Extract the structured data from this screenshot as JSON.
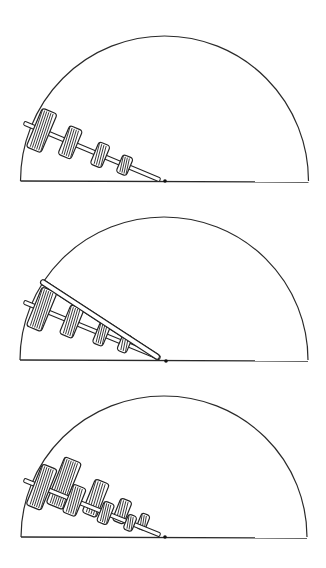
{
  "figure": {
    "stroke_color": "#222222",
    "background": "#ffffff"
  },
  "panels": [
    {
      "id": "panel-1",
      "semicircle": {
        "cx": 164.5,
        "baseline_y": 181,
        "r": 144,
        "top_y": 36
      },
      "pivot": {
        "x": 165,
        "y": 181
      },
      "shaft": {
        "x1": 24,
        "y1": 123,
        "x2": 160,
        "y2": 180,
        "angle_deg": 22.7
      },
      "gears": [
        {
          "t": 0.13,
          "w": 16,
          "h": 42
        },
        {
          "t": 0.34,
          "w": 14,
          "h": 31
        },
        {
          "t": 0.56,
          "w": 12,
          "h": 24
        },
        {
          "t": 0.74,
          "w": 11,
          "h": 19
        }
      ],
      "top_bar": null,
      "second_row": []
    },
    {
      "id": "panel-2",
      "semicircle": {
        "cx": 164,
        "baseline_y": 360,
        "r": 144,
        "top_y": 217
      },
      "pivot": {
        "x": 166,
        "y": 361
      },
      "shaft": {
        "x1": 24,
        "y1": 302,
        "x2": 160,
        "y2": 358,
        "angle_deg": 22.4
      },
      "gears": [
        {
          "t": 0.13,
          "w": 16,
          "h": 42
        },
        {
          "t": 0.35,
          "w": 14,
          "h": 31
        },
        {
          "t": 0.57,
          "w": 11,
          "h": 23
        },
        {
          "t": 0.74,
          "w": 10,
          "h": 18
        }
      ],
      "top_bar": {
        "x1": 41,
        "y1": 281,
        "x2": 159,
        "y2": 358
      },
      "second_row": []
    },
    {
      "id": "panel-3",
      "semicircle": {
        "cx": 164,
        "baseline_y": 537,
        "r": 143,
        "top_y": 396
      },
      "pivot": {
        "x": 165,
        "y": 537
      },
      "shaft": {
        "x1": 24,
        "y1": 480,
        "x2": 160,
        "y2": 535,
        "angle_deg": 22
      },
      "gears": [
        {
          "t": 0.13,
          "w": 16,
          "h": 44
        },
        {
          "t": 0.37,
          "w": 14,
          "h": 30
        },
        {
          "t": 0.6,
          "w": 11,
          "h": 22
        },
        {
          "t": 0.78,
          "w": 9,
          "h": 16
        }
      ],
      "top_bar": null,
      "second_row": [
        {
          "t": 0.26,
          "w": 18,
          "h": 50,
          "offset": -12
        },
        {
          "t": 0.5,
          "w": 15,
          "h": 36,
          "offset": -10
        },
        {
          "t": 0.7,
          "w": 12,
          "h": 24,
          "offset": -8
        },
        {
          "t": 0.86,
          "w": 9,
          "h": 16,
          "offset": -6
        }
      ]
    }
  ]
}
